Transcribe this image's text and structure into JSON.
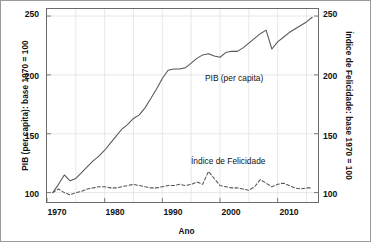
{
  "chart_data": {
    "type": "line",
    "title": "",
    "xlabel": "Ano",
    "ylabel": "PIB (per capita): base 1970 = 100",
    "ylabel_right": "Índice de Felicidade: base 1970 = 100",
    "xlim": [
      1970,
      2017
    ],
    "ylim": [
      92,
      256
    ],
    "ylim_right": [
      92,
      256
    ],
    "grid": true,
    "legend_position": "inline-annotation",
    "xticks": [
      1970,
      1980,
      1990,
      2000,
      2010
    ],
    "xtick_labels": [
      "1970",
      "1980",
      "1990",
      "2000",
      "2010"
    ],
    "yticks": [
      100,
      150,
      200,
      250
    ],
    "ytick_labels": [
      "100",
      "150",
      "200",
      "250"
    ],
    "yticks_right": [
      100,
      150,
      200,
      250
    ],
    "ytick_labels_right": [
      "100",
      "150",
      "200",
      "250"
    ],
    "series": [
      {
        "name": "PIB (per capita)",
        "style": "solid",
        "color": "#555555",
        "x": [
          1971,
          1972,
          1973,
          1974,
          1975,
          1976,
          1977,
          1978,
          1979,
          1980,
          1981,
          1982,
          1983,
          1984,
          1985,
          1986,
          1987,
          1988,
          1989,
          1990,
          1991,
          1992,
          1993,
          1994,
          1995,
          1996,
          1997,
          1998,
          1999,
          2000,
          2001,
          2002,
          2003,
          2004,
          2005,
          2006,
          2007,
          2008,
          2009,
          2010,
          2011,
          2012,
          2013,
          2014,
          2015,
          2016
        ],
        "values": [
          100,
          107,
          115,
          110,
          112,
          117,
          122,
          127,
          131,
          136,
          142,
          148,
          154,
          158,
          163,
          166,
          172,
          180,
          188,
          197,
          204,
          205,
          205,
          206,
          210,
          214,
          217,
          218,
          216,
          215,
          219,
          220,
          220,
          223,
          227,
          231,
          235,
          238,
          222,
          228,
          232,
          236,
          239,
          242,
          245,
          249
        ]
      },
      {
        "name": "Índice de Felicidade",
        "style": "dashed",
        "color": "#555555",
        "x": [
          1971,
          1972,
          1973,
          1974,
          1975,
          1976,
          1977,
          1978,
          1979,
          1980,
          1981,
          1982,
          1983,
          1984,
          1985,
          1986,
          1987,
          1988,
          1989,
          1990,
          1991,
          1992,
          1993,
          1994,
          1995,
          1996,
          1997,
          1998,
          1999,
          2000,
          2001,
          2002,
          2003,
          2004,
          2005,
          2006,
          2007,
          2008,
          2009,
          2010,
          2011,
          2012,
          2013,
          2014,
          2015,
          2016
        ],
        "values": [
          100,
          103,
          100,
          98,
          100,
          101,
          103,
          104,
          105,
          105,
          104,
          104,
          105,
          106,
          107,
          106,
          105,
          104,
          104,
          105,
          106,
          106,
          107,
          106,
          107,
          109,
          107,
          118,
          112,
          106,
          105,
          104,
          104,
          103,
          102,
          105,
          111,
          108,
          105,
          107,
          108,
          106,
          104,
          103,
          104,
          104
        ]
      }
    ],
    "annotations": [
      {
        "text": "PIB (per capita)",
        "x": 2000,
        "y": 212
      },
      {
        "text": "Índice de Felicidade",
        "x": 1997,
        "y": 130
      }
    ]
  }
}
